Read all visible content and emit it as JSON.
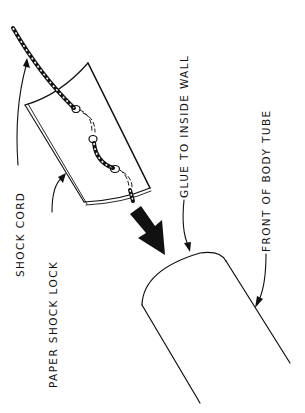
{
  "diagram": {
    "type": "technical-illustration",
    "colors": {
      "ink": "#111111",
      "background": "#ffffff"
    },
    "labels": {
      "shock_cord": "SHOCK CORD",
      "paper_shock_lock": "PAPER SHOCK LOCK",
      "glue": "GLUE TO INSIDE WALL",
      "front_body_tube": "FRONT OF BODY TUBE"
    },
    "components": [
      {
        "id": "shock-cord",
        "label": "SHOCK CORD",
        "depiction": "twisted cord threaded through paper"
      },
      {
        "id": "paper-shock-lock",
        "label": "PAPER SHOCK LOCK",
        "depiction": "curved paper rectangle"
      },
      {
        "id": "insertion-arrow",
        "label": "",
        "depiction": "solid black arrow pointing into tube"
      },
      {
        "id": "body-tube",
        "label": "FRONT OF BODY TUBE",
        "depiction": "open tube end"
      }
    ]
  }
}
